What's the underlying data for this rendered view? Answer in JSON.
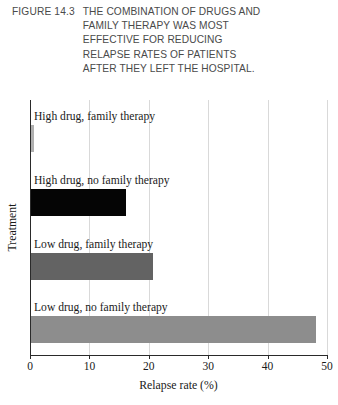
{
  "caption": {
    "number": "FIGURE 14.3",
    "lines": [
      "THE COMBINATION OF DRUGS AND",
      "FAMILY THERAPY WAS MOST",
      "EFFECTIVE FOR REDUCING",
      "RELAPSE RATES OF PATIENTS",
      "AFTER THEY LEFT THE HOSPITAL."
    ]
  },
  "chart_data": {
    "type": "bar",
    "orientation": "horizontal",
    "title": "THE COMBINATION OF DRUGS AND FAMILY THERAPY WAS MOST EFFECTIVE FOR REDUCING RELAPSE RATES OF PATIENTS AFTER THEY LEFT THE HOSPITAL.",
    "xlabel": "Relapse rate (%)",
    "ylabel": "Treatment",
    "categories": [
      "High drug, family therapy",
      "High drug, no family therapy",
      "Low drug, family therapy",
      "Low drug, no family therapy"
    ],
    "values": [
      0.5,
      16,
      20.5,
      48
    ],
    "bar_colors": [
      "#b0b0b0",
      "#050505",
      "#636363",
      "#8d8d8d"
    ],
    "xlim": [
      0,
      50
    ],
    "xticks": [
      0,
      10,
      20,
      30,
      40,
      50
    ],
    "xtick_labels": [
      "0",
      "10",
      "20",
      "30",
      "40",
      "50"
    ],
    "grid": "vertical",
    "legend": "none"
  }
}
